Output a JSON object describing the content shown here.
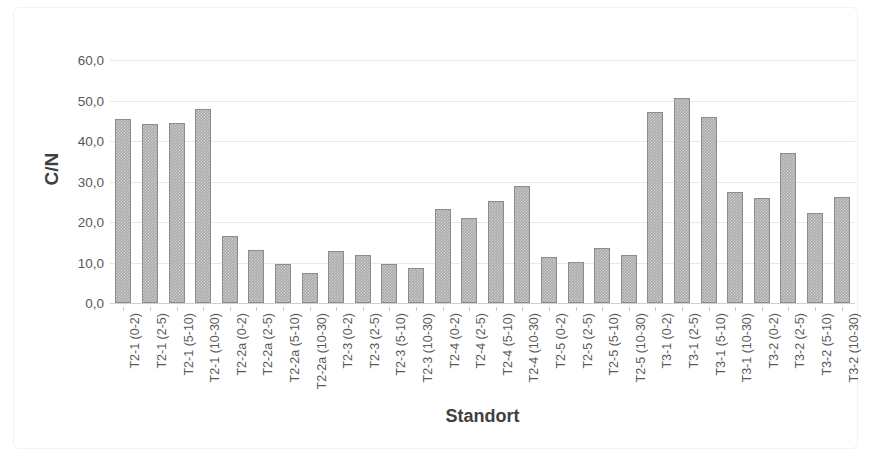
{
  "chart_data": {
    "type": "bar",
    "title": "",
    "xlabel": "Standort",
    "ylabel": "C/N",
    "ylim": [
      0,
      60
    ],
    "ytick_step": 10,
    "ytick_labels": [
      "0,0",
      "10,0",
      "20,0",
      "30,0",
      "40,0",
      "50,0",
      "60,0"
    ],
    "ytick_values": [
      0,
      10,
      20,
      30,
      40,
      50,
      60
    ],
    "decimal_separator": ",",
    "grid": "horizontal",
    "legend": "none",
    "bar_color": "#aaaaaa",
    "bar_border_color": "#8c8c8c",
    "gridline_color": "#e8e8e8",
    "categories": [
      "T2-1 (0-2)",
      "T2-1 (2-5)",
      "T2-1 (5-10)",
      "T2-1 (10-30)",
      "T2-2a (0-2)",
      "T2-2a (2-5)",
      "T2-2a (5-10)",
      "T2-2a (10-30)",
      "T2-3 (0-2)",
      "T2-3 (2-5)",
      "T2-3 (5-10)",
      "T2-3 (10-30)",
      "T2-4 (0-2)",
      "T2-4 (2-5)",
      "T2-4 (5-10)",
      "T2-4 (10-30)",
      "T2-5 (0-2)",
      "T2-5 (2-5)",
      "T2-5 (5-10)",
      "T2-5 (10-30)",
      "T3-1 (0-2)",
      "T3-1 (2-5)",
      "T3-1 (5-10)",
      "T3-1 (10-30)",
      "T3-2 (0-2)",
      "T3-2 (2-5)",
      "T3-2 (5-10)",
      "T3-2 (10-30)"
    ],
    "values": [
      45.4,
      44.2,
      44.5,
      48.0,
      16.6,
      13.2,
      9.6,
      7.5,
      12.8,
      11.8,
      9.7,
      8.7,
      23.3,
      21.0,
      25.1,
      28.8,
      11.3,
      10.2,
      13.5,
      11.9,
      47.2,
      50.5,
      45.9,
      27.5,
      25.9,
      37.1,
      22.2,
      26.2
    ]
  }
}
